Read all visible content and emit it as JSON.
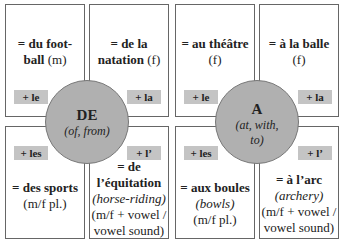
{
  "de": {
    "circle": {
      "title": "DE",
      "gloss": "(of, from)"
    },
    "top_left": {
      "line1": "= du foot-",
      "line2b": "ball",
      "line2n": " (m)",
      "tag": "+ le"
    },
    "top_right": {
      "line1": "= de la",
      "line2b": "natation",
      "line2n": " (f)",
      "tag": "+ la"
    },
    "bottom_left": {
      "tag": "+ les",
      "line1": "= des sports",
      "line2": "(m/f pl.)"
    },
    "bottom_right": {
      "tag": "+ l’",
      "line1": "= de",
      "line2": "l’équitation",
      "line3": "(horse-riding)",
      "line4": "(m/f + vowel /",
      "line5": "vowel sound)"
    }
  },
  "a": {
    "circle": {
      "title": "A",
      "gloss1": "(at, with,",
      "gloss2": "to)"
    },
    "top_left": {
      "line1": "= au théâtre",
      "line2": "(f)",
      "tag": "+ le"
    },
    "top_right": {
      "line1": "= à la balle",
      "line2": "(f)",
      "tag": "+ la"
    },
    "bottom_left": {
      "tag": "+ les",
      "line1": "= aux boules",
      "line2": "(bowls)",
      "line3": "(m/f pl.)"
    },
    "bottom_right": {
      "tag": "+ l’",
      "line1": "= à l’arc",
      "line2": "(archery)",
      "line3": "(m/f + vowel /",
      "line4": "vowel sound)"
    }
  }
}
